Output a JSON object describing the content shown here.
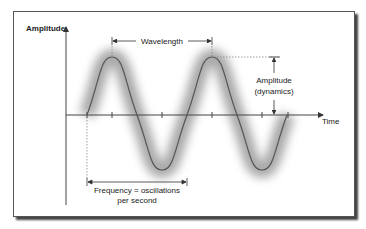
{
  "diagram": {
    "axes": {
      "y_label": "Amplitude",
      "x_label": "Time"
    },
    "annotations": {
      "wavelength": "Wavelength",
      "amplitude_line1": "Amplitude",
      "amplitude_line2": "(dynamics)",
      "frequency_line1": "Frequency = oscillations",
      "frequency_line2": "per second"
    },
    "colors": {
      "wave": "#555555",
      "glow": "#9a9a9a",
      "axis": "#444444",
      "frame_border": "#555555"
    }
  }
}
